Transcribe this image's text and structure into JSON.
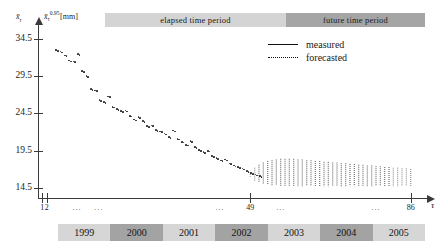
{
  "figure": {
    "type": "scatter-forecast",
    "periods": [
      {
        "label": "elapsed time period",
        "shade": "light",
        "color": "#d4d4d4"
      },
      {
        "label": "future time period",
        "shade": "dark",
        "color": "#a5a5a5"
      }
    ],
    "axes": {
      "y_label_left": "x̄",
      "y_label_left_sub": "τ",
      "y_label_right_symbol": "x̄",
      "y_label_right_sub": "τ",
      "y_label_right_sup": "0.95",
      "y_label_right_unit": "[mm]",
      "x_label": "τ",
      "y_ticks": [
        34.5,
        29.5,
        24.5,
        19.5,
        14.5
      ],
      "y_tick_labels": [
        "34.5",
        "29.5",
        "24.5",
        "19.5",
        "14.5"
      ],
      "x_ticks": [
        1,
        2,
        49,
        86
      ],
      "x_tick_labels": [
        "1",
        "2",
        "49",
        "86"
      ],
      "x_dots": [
        "...",
        "...",
        "...",
        "...",
        "..."
      ],
      "ylim": [
        13.0,
        36.5
      ],
      "xlim": [
        0,
        90
      ],
      "grid": false
    },
    "legend": {
      "position": "top-right",
      "entries": [
        {
          "label": "measured",
          "style": "solid"
        },
        {
          "label": "forecasted",
          "style": "dotted"
        }
      ]
    },
    "years": [
      {
        "label": "1999",
        "shade": "light"
      },
      {
        "label": "2000",
        "shade": "dark"
      },
      {
        "label": "2001",
        "shade": "light"
      },
      {
        "label": "2002",
        "shade": "dark"
      },
      {
        "label": "2003",
        "shade": "light"
      },
      {
        "label": "2004",
        "shade": "dark"
      },
      {
        "label": "2005",
        "shade": "light"
      }
    ]
  },
  "chart_data": {
    "type": "scatter",
    "title": "",
    "xlabel": "τ",
    "ylabel": "x̄τ 0.95 [mm]",
    "xlim": [
      0,
      90
    ],
    "ylim": [
      13.0,
      36.5
    ],
    "grid": false,
    "legend_position": "top-right",
    "series": [
      {
        "name": "measured",
        "style": "scatter",
        "x": [
          4,
          5,
          6,
          7,
          8,
          9,
          10,
          11,
          12,
          13,
          14,
          15,
          16,
          17,
          18,
          19,
          20,
          21,
          22,
          23,
          24,
          25,
          26,
          27,
          28,
          29,
          30,
          31,
          32,
          33,
          34,
          35,
          36,
          37,
          38,
          39,
          40,
          41,
          42,
          43,
          44,
          45,
          46,
          47,
          48,
          49,
          50,
          51
        ],
        "y": [
          33.1,
          32.9,
          32.4,
          31.7,
          31.6,
          32.6,
          30.3,
          29.6,
          27.9,
          27.7,
          26.4,
          26.1,
          26.9,
          25.5,
          25.2,
          24.9,
          25.0,
          24.3,
          23.8,
          24.1,
          23.6,
          22.9,
          23.0,
          22.4,
          22.2,
          21.9,
          21.4,
          22.3,
          21.2,
          20.8,
          20.4,
          20.9,
          20.1,
          19.7,
          19.4,
          19.6,
          18.9,
          18.6,
          18.3,
          18.4,
          17.9,
          17.6,
          17.4,
          17.2,
          16.9,
          16.6,
          16.4,
          16.2
        ]
      },
      {
        "name": "forecasted",
        "style": "dotted-band",
        "x_start": 49,
        "x_end": 86,
        "upper": [
          16.6,
          17.2,
          17.6,
          17.9,
          18.1,
          18.2,
          18.3,
          18.4,
          18.4,
          18.4,
          18.4,
          18.3,
          18.3,
          18.2,
          18.2,
          18.1,
          18.1,
          18.0,
          18.0,
          17.9,
          17.9,
          17.8,
          17.8,
          17.7,
          17.7,
          17.6,
          17.6,
          17.5,
          17.5,
          17.4,
          17.4,
          17.3,
          17.3,
          17.2,
          17.2,
          17.1,
          17.1,
          17.0
        ],
        "lower": [
          16.0,
          15.5,
          15.2,
          15.0,
          14.9,
          14.8,
          14.8,
          14.7,
          14.7,
          14.7,
          14.7,
          14.7,
          14.7,
          14.7,
          14.7,
          14.7,
          14.7,
          14.7,
          14.7,
          14.7,
          14.7,
          14.7,
          14.7,
          14.7,
          14.7,
          14.7,
          14.7,
          14.7,
          14.7,
          14.7,
          14.7,
          14.7,
          14.7,
          14.7,
          14.7,
          14.7,
          14.7,
          14.7
        ]
      }
    ]
  }
}
